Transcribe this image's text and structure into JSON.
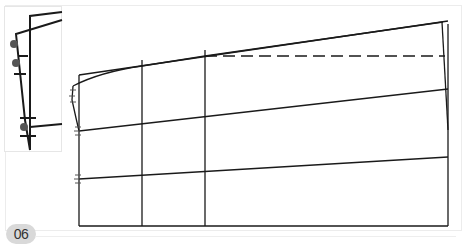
{
  "figure": {
    "step_number": "06",
    "colors": {
      "line": "#1a1a1a",
      "notch": "#555555",
      "badge_bg": "#d9d9d9",
      "badge_text": "#333333",
      "frame_border": "#ececec"
    }
  }
}
